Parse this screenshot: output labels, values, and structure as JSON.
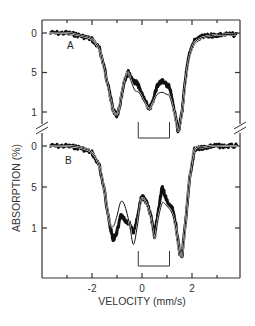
{
  "chart_data": {
    "type": "line",
    "title": "",
    "xlabel": "VELOCITY (mm/s)",
    "ylabel": "ABSORPTION (%)",
    "xlim": [
      -3.8,
      3.9
    ],
    "x_ticks": [
      -2,
      0,
      2
    ],
    "x_minor_ticks": [
      -3,
      -1,
      1,
      3
    ],
    "panels": [
      {
        "name": "A",
        "y_tick_labels": [
          "0",
          "5",
          "1"
        ],
        "y_tick_values": [
          0,
          0.5,
          1.0
        ],
        "bracket": {
          "x_start": -0.15,
          "x_end": 1.1
        },
        "series": [
          {
            "name": "A data",
            "x": [
              -3.7,
              -3.0,
              -2.5,
              -2.0,
              -1.7,
              -1.5,
              -1.3,
              -1.15,
              -1.0,
              -0.9,
              -0.7,
              -0.55,
              -0.45,
              -0.3,
              -0.2,
              -0.1,
              0.1,
              0.3,
              0.45,
              0.6,
              0.8,
              1.0,
              1.1,
              1.3,
              1.45,
              1.6,
              1.75,
              1.9,
              2.1,
              2.4,
              2.8,
              3.2,
              3.8
            ],
            "y": [
              0.0,
              0.0,
              0.03,
              0.08,
              0.2,
              0.45,
              0.75,
              0.98,
              1.05,
              0.95,
              0.6,
              0.5,
              0.55,
              0.62,
              0.63,
              0.7,
              0.85,
              0.97,
              0.85,
              0.67,
              0.6,
              0.66,
              0.68,
              1.0,
              1.25,
              1.0,
              0.55,
              0.25,
              0.1,
              0.05,
              0.03,
              0.02,
              0.02
            ]
          },
          {
            "name": "A fit",
            "x": [
              -3.7,
              -3.0,
              -2.5,
              -2.0,
              -1.7,
              -1.5,
              -1.3,
              -1.15,
              -1.0,
              -0.9,
              -0.7,
              -0.55,
              -0.45,
              -0.3,
              -0.2,
              -0.1,
              0.1,
              0.3,
              0.45,
              0.6,
              0.8,
              1.0,
              1.1,
              1.3,
              1.45,
              1.6,
              1.75,
              1.9,
              2.1,
              2.4,
              2.8,
              3.2,
              3.8
            ],
            "y": [
              0.0,
              0.0,
              0.03,
              0.08,
              0.22,
              0.48,
              0.78,
              0.98,
              1.03,
              0.92,
              0.58,
              0.5,
              0.6,
              0.72,
              0.74,
              0.76,
              0.88,
              0.96,
              0.88,
              0.78,
              0.75,
              0.78,
              0.8,
              1.02,
              1.24,
              1.0,
              0.6,
              0.3,
              0.12,
              0.06,
              0.03,
              0.02,
              0.02
            ]
          }
        ]
      },
      {
        "name": "B",
        "y_tick_labels": [
          "0",
          "5",
          "1"
        ],
        "y_tick_values": [
          0,
          0.5,
          1.0
        ],
        "bracket": {
          "x_start": -0.15,
          "x_end": 1.1
        },
        "series": [
          {
            "name": "B data",
            "x": [
              -3.7,
              -3.0,
              -2.5,
              -2.0,
              -1.7,
              -1.5,
              -1.3,
              -1.15,
              -1.0,
              -0.85,
              -0.7,
              -0.5,
              -0.35,
              -0.2,
              -0.05,
              0.05,
              0.2,
              0.35,
              0.5,
              0.65,
              0.8,
              0.9,
              1.05,
              1.2,
              1.35,
              1.5,
              1.6,
              1.75,
              1.9,
              2.1,
              2.4,
              2.8,
              3.2,
              3.8
            ],
            "y": [
              0.0,
              0.0,
              0.02,
              0.08,
              0.25,
              0.55,
              0.95,
              1.15,
              1.05,
              0.85,
              0.9,
              0.95,
              1.05,
              0.9,
              0.65,
              0.62,
              0.7,
              0.85,
              1.1,
              0.8,
              0.5,
              0.58,
              0.72,
              0.75,
              0.95,
              1.3,
              1.35,
              0.9,
              0.4,
              0.05,
              0.02,
              0.0,
              0.0,
              0.0
            ]
          },
          {
            "name": "B fit",
            "x": [
              -3.7,
              -3.0,
              -2.5,
              -2.0,
              -1.7,
              -1.5,
              -1.3,
              -1.15,
              -1.0,
              -0.85,
              -0.7,
              -0.5,
              -0.35,
              -0.2,
              -0.05,
              0.05,
              0.2,
              0.35,
              0.5,
              0.65,
              0.8,
              0.9,
              1.05,
              1.2,
              1.35,
              1.5,
              1.6,
              1.75,
              1.9,
              2.1,
              2.4,
              2.8,
              3.2,
              3.8
            ],
            "y": [
              0.0,
              0.0,
              0.02,
              0.08,
              0.25,
              0.55,
              0.92,
              0.98,
              0.85,
              0.68,
              0.72,
              0.95,
              1.2,
              1.0,
              0.68,
              0.64,
              0.72,
              0.88,
              1.12,
              0.88,
              0.7,
              0.7,
              0.75,
              0.82,
              1.0,
              1.3,
              1.33,
              0.9,
              0.4,
              0.05,
              0.02,
              0.0,
              0.0,
              0.0
            ]
          }
        ]
      }
    ],
    "grid": false,
    "legend": "none",
    "axis_break": true
  },
  "labels": {
    "xlabel": "VELOCITY (mm/s)",
    "ylabel": "ABSORPTION (%)",
    "panel_a": "A",
    "panel_b": "B",
    "x_ticks": [
      "-2",
      "0",
      "2"
    ],
    "a_ticks": [
      "0",
      "5",
      "1"
    ],
    "b_ticks": [
      "0",
      "5",
      "1"
    ]
  }
}
